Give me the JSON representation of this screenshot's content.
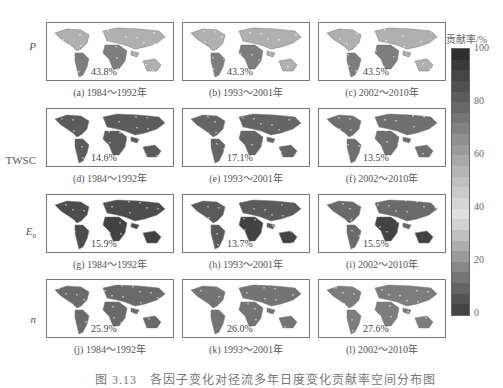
{
  "chart_data": {
    "type": "heatmap",
    "title": "",
    "rows": [
      "P",
      "TWSC",
      "E0",
      "n"
    ],
    "columns": [
      "1984～1992年",
      "1993～2001年",
      "2002～2010年"
    ],
    "panels": [
      {
        "id": "a",
        "factor": "P",
        "period": "1984～1992年",
        "value": 43.8,
        "label": "43.8%"
      },
      {
        "id": "b",
        "factor": "P",
        "period": "1993～2001年",
        "value": 43.3,
        "label": "43.3%"
      },
      {
        "id": "c",
        "factor": "P",
        "period": "2002～2010年",
        "value": 43.5,
        "label": "43.5%"
      },
      {
        "id": "d",
        "factor": "TWSC",
        "period": "1984～1992年",
        "value": 14.6,
        "label": "14.6%"
      },
      {
        "id": "e",
        "factor": "TWSC",
        "period": "1993～2001年",
        "value": 17.1,
        "label": "17.1%"
      },
      {
        "id": "f",
        "factor": "TWSC",
        "period": "2002～2010年",
        "value": 13.5,
        "label": "13.5%"
      },
      {
        "id": "g",
        "factor": "E0",
        "period": "1984～1992年",
        "value": 15.9,
        "label": "15.9%"
      },
      {
        "id": "h",
        "factor": "E0",
        "period": "1993～2001年",
        "value": 13.7,
        "label": "13.7%"
      },
      {
        "id": "i",
        "factor": "E0",
        "period": "2002～2010年",
        "value": 15.5,
        "label": "15.5%"
      },
      {
        "id": "j",
        "factor": "n",
        "period": "1984～1992年",
        "value": 25.9,
        "label": "25.9%"
      },
      {
        "id": "k",
        "factor": "n",
        "period": "1993～2001年",
        "value": 26.0,
        "label": "26.0%"
      },
      {
        "id": "l",
        "factor": "n",
        "period": "2002～2010年",
        "value": 27.6,
        "label": "27.6%"
      }
    ],
    "colorbar": {
      "title": "贡献率/%",
      "range": [
        0,
        100
      ],
      "ticks": [
        100,
        80,
        60,
        40,
        20,
        0
      ]
    },
    "legend_position": "right"
  },
  "row_labels": [
    {
      "text": "P",
      "italic": true
    },
    {
      "text": "TWSC",
      "italic": false
    },
    {
      "text": "E",
      "sub": "0",
      "italic": true
    },
    {
      "text": "n",
      "italic": true
    }
  ],
  "panels": [
    [
      {
        "pct": "43.8%",
        "caption": "(a) 1984～1992年"
      },
      {
        "pct": "43.3%",
        "caption": "(b) 1993～2001年"
      },
      {
        "pct": "43.5%",
        "caption": "(c) 2002～2010年"
      }
    ],
    [
      {
        "pct": "14.6%",
        "caption": "(d) 1984～1992年"
      },
      {
        "pct": "17.1%",
        "caption": "(e) 1993～2001年"
      },
      {
        "pct": "13.5%",
        "caption": "(f) 2002～2010年"
      }
    ],
    [
      {
        "pct": "15.9%",
        "caption": "(g) 1984～1992年"
      },
      {
        "pct": "13.7%",
        "caption": "(h) 1993～2001年"
      },
      {
        "pct": "15.5%",
        "caption": "(i) 2002～2010年"
      }
    ],
    [
      {
        "pct": "25.9%",
        "caption": "(j) 1984～1992年"
      },
      {
        "pct": "26.0%",
        "caption": "(k) 1993～2001年"
      },
      {
        "pct": "27.6%",
        "caption": "(l) 2002～2010年"
      }
    ]
  ],
  "colorbar": {
    "title": "贡献率/%",
    "ticks": [
      "100",
      "80",
      "60",
      "40",
      "20",
      "0"
    ],
    "colors": [
      "#2e2e2e",
      "#3a3a3a",
      "#454545",
      "#505050",
      "#5c5c5c",
      "#686868",
      "#757575",
      "#828282",
      "#8f8f8f",
      "#9b9b9b",
      "#a8a8a8",
      "#b4b4b4",
      "#c0c0c0",
      "#cbcbcb",
      "#d6d6d6",
      "#e0e0e0",
      "#d2d2d2",
      "#bfbfbf",
      "#adadad",
      "#9a9a9a",
      "#888888",
      "#767676",
      "#646464",
      "#535353",
      "#444444"
    ]
  },
  "figure_caption": "图 3.13　各因子变化对径流多年日度变化贡献率空间分布图"
}
